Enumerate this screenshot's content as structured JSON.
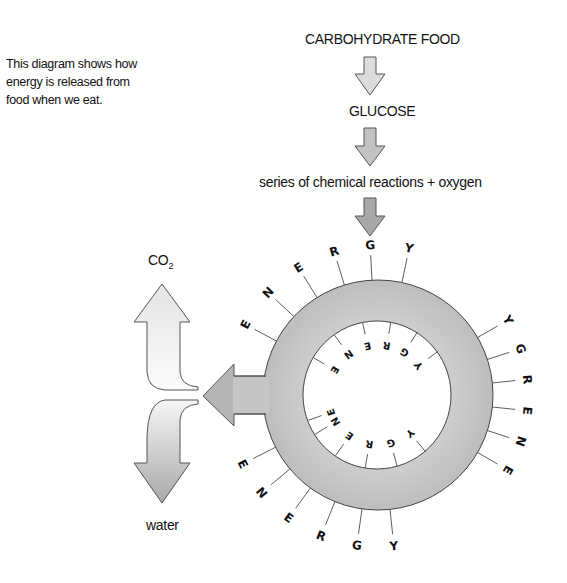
{
  "caption": {
    "lines": [
      "This diagram shows how",
      "energy is released from",
      "food when we eat."
    ]
  },
  "flow": {
    "step1": "CARBOHYDRATE FOOD",
    "step2": "GLUCOSE",
    "step3": "series of chemical reactions + oxygen"
  },
  "products": {
    "co2_main": "CO",
    "co2_sub": "2",
    "water": "water"
  },
  "ring": {
    "label": "ENERGY",
    "outer_labels": [
      "ENERGY",
      "ENERGY",
      "ENERGY"
    ],
    "inner_labels": [
      "ENERGY",
      "ENERGY"
    ]
  },
  "colors": {
    "arrow_light": "#e6e6e6",
    "arrow_mid": "#c8c8c8",
    "arrow_dark": "#a9a9a9",
    "ring_fill": "#c4c4c4",
    "stroke": "#444444"
  }
}
